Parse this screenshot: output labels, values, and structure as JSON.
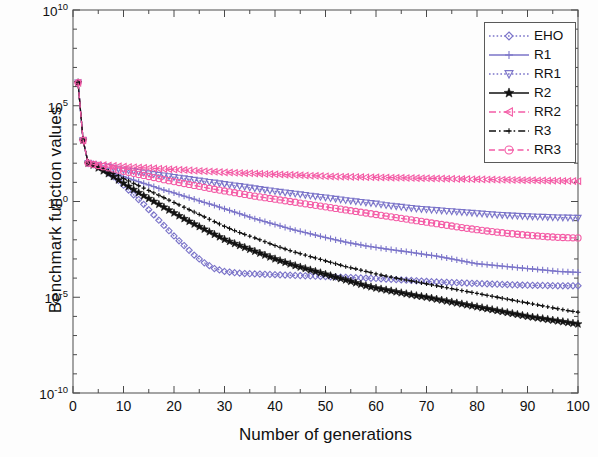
{
  "chart_data": {
    "type": "line",
    "title": "",
    "xlabel": "Number of generations",
    "ylabel": "Benchmark function values",
    "xlim": [
      0,
      100
    ],
    "ylim": [
      1e-10,
      10000000000.0
    ],
    "yscale": "log",
    "grid": false,
    "legend_position": "top-right",
    "xticks": [
      "0",
      "10",
      "20",
      "30",
      "40",
      "50",
      "60",
      "70",
      "80",
      "90",
      "100"
    ],
    "yticks": [
      "10^10",
      "10^5",
      "10^0",
      "10^-5",
      "10^-10"
    ],
    "ytick_labels": [
      {
        "base": "10",
        "exp": "10"
      },
      {
        "base": "10",
        "exp": "5"
      },
      {
        "base": "10",
        "exp": "0"
      },
      {
        "base": "10",
        "exp": "-5"
      },
      {
        "base": "10",
        "exp": "-10"
      }
    ],
    "x": [
      1,
      2,
      3,
      4,
      5,
      6,
      7,
      8,
      9,
      10,
      12,
      14,
      16,
      18,
      20,
      22,
      24,
      26,
      28,
      30,
      32,
      34,
      36,
      38,
      40,
      42,
      44,
      46,
      48,
      50,
      52,
      54,
      56,
      58,
      60,
      62,
      64,
      66,
      68,
      70,
      72,
      74,
      76,
      78,
      80,
      82,
      84,
      86,
      88,
      90,
      92,
      94,
      96,
      98,
      100
    ],
    "series": [
      {
        "name": "EHO",
        "color": "#7b74c9",
        "marker": "diamond",
        "linestyle": "dotted",
        "log10_values": [
          6.2,
          3.2,
          2.0,
          1.95,
          1.85,
          1.7,
          1.5,
          1.3,
          1.1,
          0.85,
          0.35,
          -0.15,
          -0.7,
          -1.25,
          -1.8,
          -2.3,
          -2.8,
          -3.2,
          -3.5,
          -3.65,
          -3.72,
          -3.76,
          -3.78,
          -3.8,
          -3.82,
          -3.84,
          -3.86,
          -3.88,
          -3.9,
          -3.92,
          -3.94,
          -3.96,
          -3.98,
          -4.0,
          -4.02,
          -4.05,
          -4.08,
          -4.11,
          -4.14,
          -4.17,
          -4.2,
          -4.22,
          -4.24,
          -4.26,
          -4.28,
          -4.3,
          -4.32,
          -4.34,
          -4.36,
          -4.37,
          -4.38,
          -4.39,
          -4.4,
          -4.4,
          -4.4
        ]
      },
      {
        "name": "R1",
        "color": "#7b74c9",
        "marker": "plus",
        "linestyle": "solid",
        "log10_values": [
          6.2,
          3.2,
          2.0,
          1.9,
          1.8,
          1.7,
          1.6,
          1.5,
          1.4,
          1.3,
          1.12,
          0.95,
          0.78,
          0.6,
          0.45,
          0.28,
          0.12,
          -0.05,
          -0.2,
          -0.38,
          -0.55,
          -0.72,
          -0.9,
          -1.05,
          -1.2,
          -1.35,
          -1.5,
          -1.62,
          -1.75,
          -1.88,
          -2.0,
          -2.12,
          -2.22,
          -2.32,
          -2.4,
          -2.48,
          -2.55,
          -2.62,
          -2.7,
          -2.78,
          -2.85,
          -2.95,
          -3.05,
          -3.15,
          -3.25,
          -3.3,
          -3.35,
          -3.4,
          -3.45,
          -3.5,
          -3.55,
          -3.6,
          -3.65,
          -3.68,
          -3.7
        ]
      },
      {
        "name": "RR1",
        "color": "#7b74c9",
        "marker": "triangle-down",
        "linestyle": "dotted",
        "log10_values": [
          6.2,
          3.2,
          2.0,
          1.95,
          1.9,
          1.85,
          1.8,
          1.75,
          1.7,
          1.65,
          1.58,
          1.5,
          1.42,
          1.35,
          1.27,
          1.2,
          1.12,
          1.05,
          0.98,
          0.9,
          0.83,
          0.76,
          0.68,
          0.6,
          0.53,
          0.46,
          0.4,
          0.33,
          0.26,
          0.2,
          0.13,
          0.06,
          0.0,
          -0.06,
          -0.12,
          -0.2,
          -0.26,
          -0.32,
          -0.38,
          -0.42,
          -0.46,
          -0.5,
          -0.54,
          -0.58,
          -0.62,
          -0.66,
          -0.7,
          -0.73,
          -0.76,
          -0.78,
          -0.8,
          -0.82,
          -0.84,
          -0.85,
          -0.86
        ]
      },
      {
        "name": "R2",
        "color": "#111111",
        "marker": "star",
        "linestyle": "solid",
        "log10_values": [
          6.2,
          3.2,
          2.0,
          1.9,
          1.75,
          1.6,
          1.45,
          1.3,
          1.12,
          0.95,
          0.62,
          0.3,
          0.0,
          -0.3,
          -0.6,
          -0.9,
          -1.18,
          -1.45,
          -1.72,
          -1.98,
          -2.2,
          -2.4,
          -2.6,
          -2.8,
          -3.0,
          -3.18,
          -3.35,
          -3.5,
          -3.65,
          -3.8,
          -3.95,
          -4.1,
          -4.25,
          -4.4,
          -4.52,
          -4.62,
          -4.72,
          -4.82,
          -4.92,
          -5.0,
          -5.1,
          -5.2,
          -5.3,
          -5.4,
          -5.5,
          -5.6,
          -5.7,
          -5.8,
          -5.9,
          -6.0,
          -6.08,
          -6.16,
          -6.24,
          -6.32,
          -6.4
        ]
      },
      {
        "name": "RR2",
        "color": "#f45ca6",
        "marker": "triangle-left",
        "linestyle": "dashdot",
        "log10_values": [
          6.2,
          3.2,
          2.0,
          1.95,
          1.92,
          1.9,
          1.88,
          1.86,
          1.84,
          1.82,
          1.79,
          1.76,
          1.73,
          1.7,
          1.67,
          1.64,
          1.61,
          1.58,
          1.55,
          1.52,
          1.5,
          1.48,
          1.46,
          1.44,
          1.42,
          1.4,
          1.38,
          1.36,
          1.34,
          1.32,
          1.3,
          1.29,
          1.28,
          1.27,
          1.26,
          1.25,
          1.24,
          1.23,
          1.22,
          1.21,
          1.2,
          1.19,
          1.18,
          1.17,
          1.16,
          1.15,
          1.14,
          1.13,
          1.12,
          1.11,
          1.1,
          1.09,
          1.08,
          1.07,
          1.06
        ]
      },
      {
        "name": "R3",
        "color": "#111111",
        "marker": "plus-small",
        "linestyle": "dashdot",
        "log10_values": [
          6.2,
          3.2,
          2.0,
          1.9,
          1.8,
          1.7,
          1.58,
          1.46,
          1.34,
          1.2,
          0.95,
          0.7,
          0.45,
          0.2,
          -0.05,
          -0.3,
          -0.55,
          -0.8,
          -1.05,
          -1.3,
          -1.52,
          -1.72,
          -1.9,
          -2.1,
          -2.3,
          -2.48,
          -2.65,
          -2.8,
          -2.95,
          -3.1,
          -3.25,
          -3.4,
          -3.52,
          -3.65,
          -3.78,
          -3.9,
          -4.0,
          -4.1,
          -4.2,
          -4.3,
          -4.4,
          -4.5,
          -4.6,
          -4.7,
          -4.8,
          -4.9,
          -5.0,
          -5.1,
          -5.2,
          -5.3,
          -5.4,
          -5.5,
          -5.6,
          -5.7,
          -5.78
        ]
      },
      {
        "name": "RR3",
        "color": "#f45ca6",
        "marker": "circle",
        "linestyle": "dashed",
        "log10_values": [
          6.2,
          3.2,
          2.0,
          1.94,
          1.88,
          1.82,
          1.76,
          1.7,
          1.64,
          1.58,
          1.47,
          1.36,
          1.25,
          1.14,
          1.04,
          0.94,
          0.84,
          0.74,
          0.64,
          0.55,
          0.46,
          0.37,
          0.28,
          0.2,
          0.12,
          0.04,
          -0.04,
          -0.12,
          -0.2,
          -0.28,
          -0.36,
          -0.44,
          -0.52,
          -0.6,
          -0.68,
          -0.76,
          -0.84,
          -0.92,
          -1.0,
          -1.08,
          -1.16,
          -1.24,
          -1.32,
          -1.4,
          -1.47,
          -1.54,
          -1.6,
          -1.66,
          -1.71,
          -1.76,
          -1.8,
          -1.84,
          -1.87,
          -1.89,
          -1.9
        ]
      }
    ]
  },
  "axes": {
    "ylabel_text": "Benchmark function values",
    "xlabel_text": "Number of generations"
  },
  "legend": {
    "entries": [
      {
        "label": "EHO"
      },
      {
        "label": "R1"
      },
      {
        "label": "RR1"
      },
      {
        "label": "R2"
      },
      {
        "label": "RR2"
      },
      {
        "label": "R3"
      },
      {
        "label": "RR3"
      }
    ]
  }
}
